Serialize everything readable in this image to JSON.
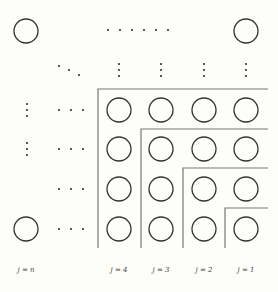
{
  "diagram": {
    "colors": {
      "stroke": "#333333",
      "line": "#777777",
      "background": "#fdfdfa"
    },
    "column_labels": [
      {
        "id": "n",
        "text": "j = n",
        "x": 26
      },
      {
        "id": "4",
        "text": "j = 4",
        "x": 119
      },
      {
        "id": "3",
        "text": "j = 3",
        "x": 161
      },
      {
        "id": "2",
        "text": "j = 2",
        "x": 204
      },
      {
        "id": "1",
        "text": "j = 1",
        "x": 246
      }
    ],
    "ellipsis": {
      "horizontal": "······",
      "diagonal": "⋱",
      "vertical": "⋮",
      "row": "···"
    },
    "grid": {
      "columns_x": [
        119,
        161,
        204,
        246
      ],
      "rows_y": [
        110,
        149,
        189,
        229
      ],
      "circle_radius": 12
    },
    "corner_nodes": [
      {
        "name": "top-left",
        "x": 26,
        "y": 31
      },
      {
        "name": "top-right",
        "x": 246,
        "y": 31
      },
      {
        "name": "bottom-left",
        "x": 26,
        "y": 229
      }
    ],
    "boundaries": [
      {
        "level": 4,
        "corner_x": 98,
        "corner_y": 89
      },
      {
        "level": 3,
        "corner_x": 141,
        "corner_y": 129
      },
      {
        "level": 2,
        "corner_x": 183,
        "corner_y": 168
      },
      {
        "level": 1,
        "corner_x": 225,
        "corner_y": 208
      }
    ]
  }
}
